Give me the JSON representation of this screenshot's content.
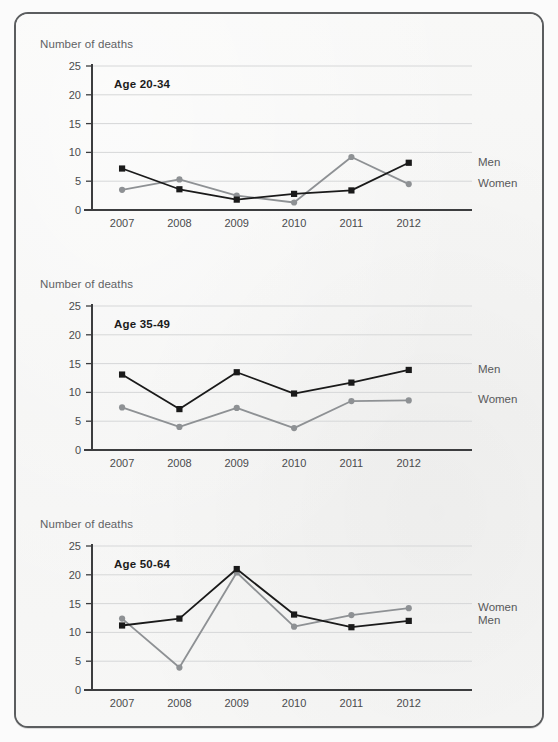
{
  "page": {
    "background_color": "#f6f6f5",
    "border_color": "#5b5d5f"
  },
  "style": {
    "men_color": "#1a1a1a",
    "women_color": "#8e9194",
    "grid_color": "#d6d7d8",
    "axis_color": "#3c3d3f",
    "tick_label_color": "#4a4b4d",
    "axis_title_color": "#5f6265",
    "legend_color": "#58595b"
  },
  "charts": [
    {
      "axis_title": "Number of deaths",
      "label": "Age 20-34",
      "legend": {
        "top": "Men",
        "bottom": "Women"
      },
      "chart_data": {
        "type": "line",
        "title": "Age 20-34",
        "xlabel": "",
        "ylabel": "Number of deaths",
        "ylim": [
          0,
          25
        ],
        "yticks": [
          0,
          5,
          10,
          15,
          20,
          25
        ],
        "grid": true,
        "legend_position": "right",
        "categories": [
          "2007",
          "2008",
          "2009",
          "2010",
          "2011",
          "2012"
        ],
        "series": [
          {
            "name": "Men",
            "color": "#1a1a1a",
            "marker": "square",
            "values": [
              7.2,
              3.6,
              1.8,
              2.8,
              3.4,
              8.2
            ]
          },
          {
            "name": "Women",
            "color": "#8e9194",
            "marker": "circle",
            "values": [
              3.5,
              5.3,
              2.5,
              1.3,
              9.2,
              4.5
            ]
          }
        ]
      }
    },
    {
      "axis_title": "Number of deaths",
      "label": "Age 35-49",
      "legend": {
        "top": "Men",
        "bottom": "Women"
      },
      "chart_data": {
        "type": "line",
        "title": "Age 35-49",
        "xlabel": "",
        "ylabel": "Number of deaths",
        "ylim": [
          0,
          25
        ],
        "yticks": [
          0,
          5,
          10,
          15,
          20,
          25
        ],
        "grid": true,
        "legend_position": "right",
        "categories": [
          "2007",
          "2008",
          "2009",
          "2010",
          "2011",
          "2012"
        ],
        "series": [
          {
            "name": "Men",
            "color": "#1a1a1a",
            "marker": "square",
            "values": [
              13.1,
              7.1,
              13.5,
              9.8,
              11.7,
              13.9
            ]
          },
          {
            "name": "Women",
            "color": "#8e9194",
            "marker": "circle",
            "values": [
              7.4,
              4.0,
              7.3,
              3.8,
              8.5,
              8.6
            ]
          }
        ]
      }
    },
    {
      "axis_title": "Number of deaths",
      "label": "Age 50-64",
      "legend": {
        "top": "Women",
        "bottom": "Men"
      },
      "chart_data": {
        "type": "line",
        "title": "Age 50-64",
        "xlabel": "",
        "ylabel": "Number of deaths",
        "ylim": [
          0,
          25
        ],
        "yticks": [
          0,
          5,
          10,
          15,
          20,
          25
        ],
        "grid": true,
        "legend_position": "right",
        "categories": [
          "2007",
          "2008",
          "2009",
          "2010",
          "2011",
          "2012"
        ],
        "series": [
          {
            "name": "Men",
            "color": "#1a1a1a",
            "marker": "square",
            "values": [
              11.2,
              12.4,
              21.0,
              13.1,
              10.9,
              12.0
            ]
          },
          {
            "name": "Women",
            "color": "#8e9194",
            "marker": "circle",
            "values": [
              12.4,
              3.9,
              20.4,
              11.0,
              13.0,
              14.2
            ]
          }
        ]
      }
    }
  ]
}
